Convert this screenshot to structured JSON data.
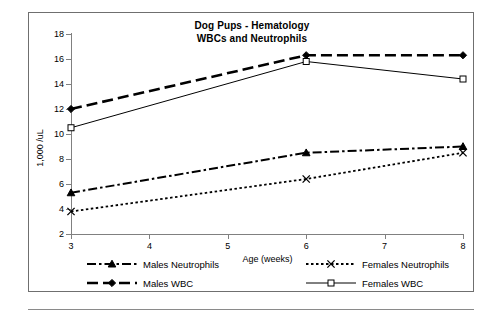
{
  "chart_data": {
    "type": "line",
    "title": "Dog Pups - Hematology",
    "subtitle": "WBCs and Neutrophils",
    "xlabel": "Age (weeks)",
    "ylabel": "1,000 /uL",
    "x": [
      3,
      6,
      8
    ],
    "xlim": [
      3,
      8
    ],
    "ylim": [
      2,
      18
    ],
    "xticks": [
      3,
      4,
      5,
      6,
      7,
      8
    ],
    "yticks": [
      2,
      4,
      6,
      8,
      10,
      12,
      14,
      16,
      18
    ],
    "grid": false,
    "legend_position": "below-plot",
    "series": [
      {
        "name": "Males Neutrophils",
        "values": [
          5.3,
          8.5,
          9.0
        ],
        "marker": "triangle",
        "dash": "dash-dot",
        "color": "#000000"
      },
      {
        "name": "Males WBC",
        "values": [
          12.0,
          16.3,
          16.3
        ],
        "marker": "diamond",
        "dash": "long-dash",
        "color": "#000000"
      },
      {
        "name": "Females Neutrophils",
        "values": [
          3.8,
          6.4,
          8.5
        ],
        "marker": "cross",
        "dash": "dotted",
        "color": "#000000"
      },
      {
        "name": "Females WBC",
        "values": [
          10.5,
          15.8,
          14.4
        ],
        "marker": "square-open",
        "dash": "solid",
        "color": "#000000"
      }
    ]
  },
  "axis": {
    "y_tick_labels": [
      "18",
      "16",
      "14",
      "12",
      "10",
      "8",
      "6",
      "4",
      "2"
    ],
    "x_tick_labels": [
      "3",
      "4",
      "5",
      "6",
      "7",
      "8"
    ],
    "y_title": "1,000 /uL",
    "x_title": "Age (weeks)"
  },
  "titles": {
    "line1": "Dog Pups - Hematology",
    "line2": "WBCs and Neutrophils"
  },
  "legend": {
    "items": [
      {
        "label": "Males Neutrophils"
      },
      {
        "label": "Females Neutrophils"
      },
      {
        "label": "Males WBC"
      },
      {
        "label": "Females WBC"
      }
    ]
  },
  "colors": {
    "ink": "#000000",
    "axis": "#808080",
    "frame": "#6f6f6f",
    "background": "#ffffff"
  }
}
